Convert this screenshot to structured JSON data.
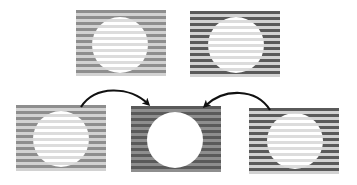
{
  "diagram": {
    "type": "stripe-illusion-figure",
    "colors": {
      "dark_stripe": "#5a5a5a",
      "medium_stripe": "#8e8e8e",
      "light_stripe": "#d2d2d2",
      "circle_light_stripe": "#dcdcdc",
      "white": "#ffffff",
      "arrow": "#111111"
    },
    "panels": [
      {
        "id": "top-left",
        "x": 76,
        "y": 10,
        "stripe_a": "#8e8e8e",
        "stripe_b": "#d2d2d2",
        "circle": "striped"
      },
      {
        "id": "top-right",
        "x": 190,
        "y": 11,
        "stripe_a": "#5a5a5a",
        "stripe_b": "#d2d2d2",
        "circle": "striped"
      },
      {
        "id": "bottom-left",
        "x": 16,
        "y": 105,
        "stripe_a": "#8e8e8e",
        "stripe_b": "#d2d2d2",
        "circle": "striped"
      },
      {
        "id": "bottom-center",
        "x": 131,
        "y": 106,
        "stripe_a": "#5a5a5a",
        "stripe_b": "#8e8e8e",
        "circle": "solid-white"
      },
      {
        "id": "bottom-right",
        "x": 249,
        "y": 108,
        "stripe_a": "#5a5a5a",
        "stripe_b": "#d2d2d2",
        "circle": "striped"
      }
    ],
    "arrows": [
      {
        "id": "arrow-left-to-center",
        "from": "bottom-left",
        "to": "bottom-center"
      },
      {
        "id": "arrow-right-to-center",
        "from": "bottom-right",
        "to": "bottom-center"
      }
    ]
  }
}
